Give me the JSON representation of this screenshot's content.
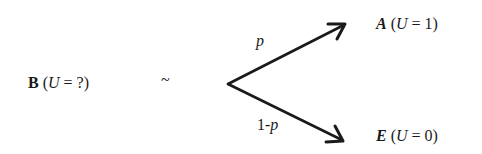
{
  "diagram": {
    "type": "lottery-decision",
    "left": {
      "symbol": "B",
      "paren_open": " (",
      "var": "U",
      "rest": " = ?)"
    },
    "tilde": "~",
    "upper_branch": {
      "probability": "p",
      "outcome": {
        "symbol": "A",
        "paren_open": " (",
        "var": "U",
        "rest": " = 1)"
      }
    },
    "lower_branch": {
      "prob_prefix": "1-",
      "probability_var": "p",
      "outcome": {
        "symbol": "E",
        "paren_open": " (",
        "var": "U",
        "rest": " = 0)"
      }
    },
    "colors": {
      "ink": "#1a1a1a",
      "background": "#ffffff"
    }
  }
}
